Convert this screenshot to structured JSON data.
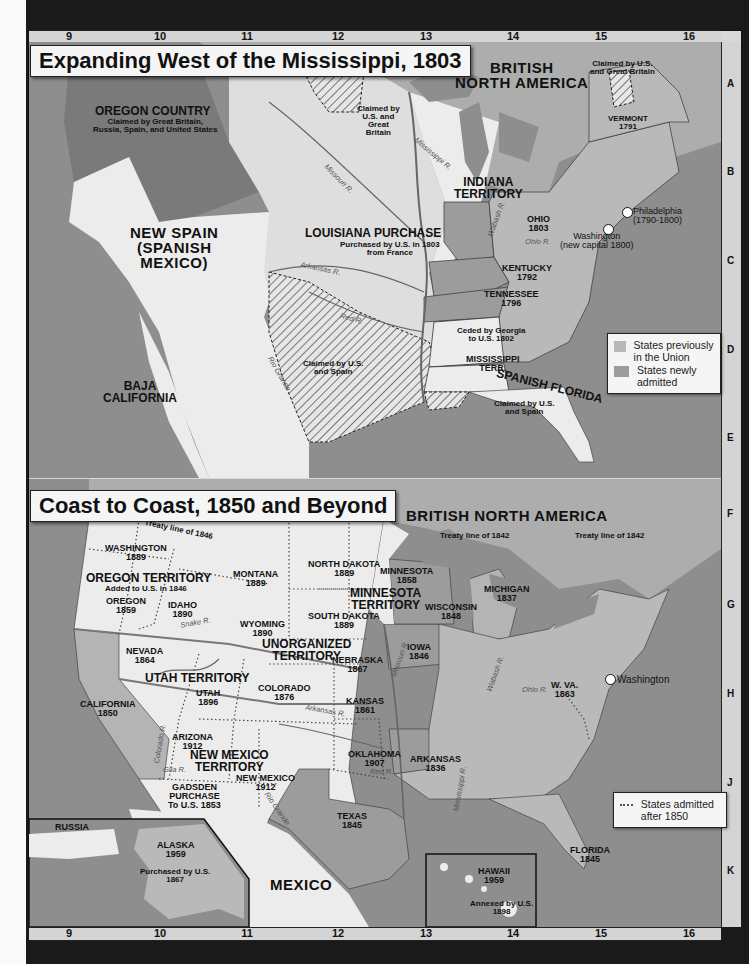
{
  "grid": {
    "columns": [
      "9",
      "10",
      "11",
      "12",
      "13",
      "14",
      "15",
      "16"
    ],
    "rows": [
      "A",
      "B",
      "C",
      "D",
      "E",
      "F",
      "G",
      "H",
      "J",
      "K"
    ]
  },
  "map1": {
    "title": "Expanding West of the Mississippi, 1803",
    "labels": {
      "british_na": [
        "BRITISH",
        "NORTH AMERICA"
      ],
      "oregon_country": "OREGON COUNTRY",
      "oregon_claim": [
        "Claimed by Great Britain,",
        "Russia, Spain, and United States"
      ],
      "new_spain": [
        "NEW SPAIN",
        "(SPANISH",
        "MEXICO)"
      ],
      "louisiana": "LOUISIANA PURCHASE",
      "louisiana_sub": [
        "Purchased by U.S. in 1803",
        "from France"
      ],
      "claim_us_gb_west": [
        "Claimed by",
        "U.S. and",
        "Great",
        "Britain"
      ],
      "claim_us_gb_east": [
        "Claimed by U.S.",
        "and Great Britain"
      ],
      "indiana": [
        "INDIANA",
        "TERRITORY"
      ],
      "vermont": [
        "VERMONT",
        "1791"
      ],
      "ohio": [
        "OHIO",
        "1803"
      ],
      "kentucky": [
        "KENTUCKY",
        "1792"
      ],
      "tennessee": [
        "TENNESSEE",
        "1796"
      ],
      "ceded_georgia": [
        "Ceded by Georgia",
        "to U.S. 1802"
      ],
      "mississippi_terr": [
        "MISSISSIPPI",
        "TERR."
      ],
      "spanish_florida": "SPANISH FLORIDA",
      "claim_us_spain_fl": [
        "Claimed by U.S.",
        "and Spain"
      ],
      "claim_us_spain_tx": [
        "Claimed by U.S.",
        "and Spain"
      ],
      "baja": [
        "BAJA",
        "CALIFORNIA"
      ],
      "philadelphia": [
        "Philadelphia",
        "(1790-1800)"
      ],
      "washington": [
        "Washington",
        "(new capital 1800)"
      ]
    },
    "rivers": [
      "Mississippi R.",
      "Missouri R.",
      "Arkansas R.",
      "Red R.",
      "Rio Grande",
      "Wabash R.",
      "Ohio R."
    ],
    "legend": [
      {
        "label": "States previously in the Union",
        "color": "#b9b9b9"
      },
      {
        "label": "States newly admitted",
        "color": "#9c9c9c"
      }
    ]
  },
  "map2": {
    "title": "Coast to Coast, 1850 and Beyond",
    "labels": {
      "british_na": "BRITISH NORTH AMERICA",
      "treaty_1846": "Treaty line of 1846",
      "treaty_1842_a": "Treaty line of 1842",
      "treaty_1842_b": "Treaty line of 1842",
      "washington": [
        "WASHINGTON",
        "1889"
      ],
      "oregon_terr": "OREGON TERRITORY",
      "oregon_terr_sub": "Added to U.S. in 1846",
      "oregon": [
        "OREGON",
        "1859"
      ],
      "idaho": [
        "IDAHO",
        "1890"
      ],
      "montana": [
        "MONTANA",
        "1889"
      ],
      "wyoming": [
        "WYOMING",
        "1890"
      ],
      "north_dakota": [
        "NORTH DAKOTA",
        "1889"
      ],
      "south_dakota": [
        "SOUTH DAKOTA",
        "1889"
      ],
      "minnesota": [
        "MINNESOTA",
        "1858"
      ],
      "minnesota_terr": [
        "MINNESOTA",
        "TERRITORY"
      ],
      "wisconsin": [
        "WISCONSIN",
        "1848"
      ],
      "michigan": [
        "MICHIGAN",
        "1837"
      ],
      "iowa": [
        "IOWA",
        "1846"
      ],
      "unorganized": [
        "UNORGANIZED",
        "TERRITORY"
      ],
      "nebraska": [
        "NEBRASKA",
        "1867"
      ],
      "nevada": [
        "NEVADA",
        "1864"
      ],
      "utah_terr": "UTAH TERRITORY",
      "utah": [
        "UTAH",
        "1896"
      ],
      "colorado": [
        "COLORADO",
        "1876"
      ],
      "kansas": [
        "KANSAS",
        "1861"
      ],
      "california": [
        "CALIFORNIA",
        "1850"
      ],
      "arizona": [
        "ARIZONA",
        "1912"
      ],
      "nm_terr": [
        "NEW MEXICO",
        "TERRITORY"
      ],
      "new_mexico": [
        "NEW MEXICO",
        "1912"
      ],
      "gadsden": [
        "GADSDEN",
        "PURCHASE",
        "To U.S. 1853"
      ],
      "oklahoma": [
        "OKLAHOMA",
        "1907"
      ],
      "arkansas": [
        "ARKANSAS",
        "1836"
      ],
      "texas": [
        "TEXAS",
        "1845"
      ],
      "florida": [
        "FLORIDA",
        "1845"
      ],
      "wva": [
        "W. VA.",
        "1863"
      ],
      "washington_dc": "Washington",
      "mexico": "MEXICO",
      "russia": "RUSSIA",
      "alaska": [
        "ALASKA",
        "1959"
      ],
      "alaska_sub": [
        "Purchased by U.S.",
        "1867"
      ],
      "hawaii": [
        "HAWAII",
        "1959"
      ],
      "hawaii_sub": [
        "Annexed by U.S.",
        "1898"
      ]
    },
    "rivers": [
      "Snake R.",
      "Colorado R.",
      "Gila R.",
      "Arkansas R.",
      "Red R.",
      "Rio Grande",
      "Missouri R.",
      "Mississippi R.",
      "Wabash R.",
      "Ohio R."
    ],
    "legend": [
      {
        "label": "States admitted after 1850",
        "style": "dotted"
      }
    ]
  }
}
